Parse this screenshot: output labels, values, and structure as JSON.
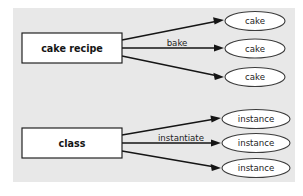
{
  "figure": {
    "background_color": "#ffffff",
    "panel_color": "#e8e8e8",
    "box_fill": "#ffffff",
    "ellipse_fill": "#ffffff",
    "line_color": "#151515",
    "text_color": "#232323"
  },
  "groups": [
    {
      "id": "cake-group",
      "source": {
        "label": "cake recipe",
        "shape": "rectangle"
      },
      "edge_label": "bake",
      "targets": [
        {
          "label": "cake",
          "shape": "ellipse"
        },
        {
          "label": "cake",
          "shape": "ellipse"
        },
        {
          "label": "cake",
          "shape": "ellipse"
        }
      ]
    },
    {
      "id": "class-group",
      "source": {
        "label": "class",
        "shape": "rectangle"
      },
      "edge_label": "instantiate",
      "targets": [
        {
          "label": "instance",
          "shape": "ellipse"
        },
        {
          "label": "instance",
          "shape": "ellipse"
        },
        {
          "label": "instance",
          "shape": "ellipse"
        }
      ]
    }
  ]
}
